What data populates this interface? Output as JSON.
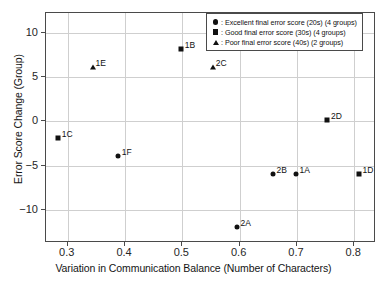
{
  "chart_data": {
    "type": "scatter",
    "title": "",
    "xlabel": "Variation in Communication Balance (Number of Characters)",
    "ylabel": "Error Score Change (Group)",
    "xlim": [
      0.262,
      0.838
    ],
    "ylim": [
      -13.7,
      12.2
    ],
    "xticks": [
      "0.3",
      "0.4",
      "0.5",
      "0.6",
      "0.7",
      "0.8"
    ],
    "xtick_values": [
      0.3,
      0.4,
      0.5,
      0.6,
      0.7,
      0.8
    ],
    "yticks": [
      "10",
      "5",
      "0",
      "−5",
      "−10"
    ],
    "ytick_values": [
      10,
      5,
      0,
      -5,
      -10
    ],
    "grid": true,
    "legend_position": "top-right",
    "marker_color": "#111111",
    "series": [
      {
        "name": "Excellent final error score (20s) (4 groups)",
        "marker": "circle",
        "points": [
          {
            "label": "1A",
            "x": 0.7,
            "y": -6
          },
          {
            "label": "1F",
            "x": 0.39,
            "y": -4
          },
          {
            "label": "2A",
            "x": 0.597,
            "y": -12
          },
          {
            "label": "2B",
            "x": 0.66,
            "y": -6
          }
        ]
      },
      {
        "name": "Good final error score (30s) (4 groups)",
        "marker": "square",
        "points": [
          {
            "label": "1B",
            "x": 0.5,
            "y": 8
          },
          {
            "label": "1C",
            "x": 0.285,
            "y": -2
          },
          {
            "label": "1D",
            "x": 0.81,
            "y": -6
          },
          {
            "label": "2D",
            "x": 0.755,
            "y": 0
          }
        ]
      },
      {
        "name": "Poor final error score (40s) (2 groups)",
        "marker": "triangle",
        "points": [
          {
            "label": "1E",
            "x": 0.345,
            "y": 6
          },
          {
            "label": "2C",
            "x": 0.555,
            "y": 6
          }
        ]
      }
    ]
  },
  "legend": {
    "entries": [
      {
        "symbol": "circle",
        "text": ": Excellent final error score (20s) (4 groups)"
      },
      {
        "symbol": "square",
        "text": ": Good final error score (30s) (4 groups)"
      },
      {
        "symbol": "triangle",
        "text": ": Poor final error score (40s) (2 groups)"
      }
    ]
  }
}
